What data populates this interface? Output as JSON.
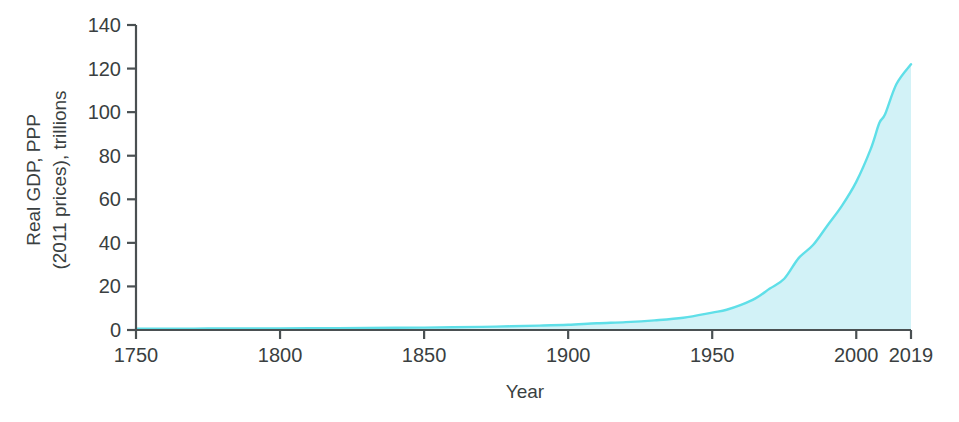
{
  "chart_data": {
    "type": "area",
    "title": "",
    "subtitle": "",
    "xlabel": "Year",
    "ylabel": "Real GDP, PPP\n(2011 prices), trillions",
    "ylabel_line1": "Real GDP, PPP",
    "ylabel_line2": "(2011 prices), trillions",
    "xlim": [
      1750,
      2019
    ],
    "ylim": [
      0,
      140
    ],
    "grid": false,
    "legend": false,
    "legend_position": "none",
    "xticks": [
      1750,
      1800,
      1850,
      1900,
      1950,
      2000,
      2019
    ],
    "xtick_labels": [
      "1750",
      "1800",
      "1850",
      "1900",
      "1950",
      "2000",
      "2019"
    ],
    "yticks": [
      0,
      20,
      40,
      60,
      80,
      100,
      120,
      140
    ],
    "ytick_labels": [
      "0",
      "20",
      "40",
      "60",
      "80",
      "100",
      "120",
      "140"
    ],
    "series": [
      {
        "name": "Real GDP, PPP (2011 prices), trillions",
        "fill_color": "#d2f2f7",
        "line_color": "#5fdfe8",
        "x": [
          1750,
          1760,
          1770,
          1780,
          1790,
          1800,
          1810,
          1820,
          1830,
          1840,
          1850,
          1860,
          1870,
          1880,
          1890,
          1900,
          1910,
          1920,
          1930,
          1940,
          1950,
          1955,
          1960,
          1965,
          1970,
          1975,
          1980,
          1985,
          1990,
          1995,
          2000,
          2005,
          2008,
          2010,
          2014,
          2019
        ],
        "values": [
          0.6,
          0.62,
          0.65,
          0.68,
          0.72,
          0.76,
          0.82,
          0.88,
          0.95,
          1.02,
          1.1,
          1.25,
          1.45,
          1.7,
          2.0,
          2.4,
          3.1,
          3.6,
          4.4,
          5.6,
          8.0,
          9.3,
          11.5,
          14.5,
          19.0,
          23.5,
          33.0,
          39.0,
          48.0,
          57.0,
          68.0,
          83.0,
          95.0,
          99.0,
          113.0,
          122.0
        ]
      }
    ],
    "annotations": []
  },
  "axes": {
    "y_title_line1": "Real GDP, PPP",
    "y_title_line2": "(2011 prices), trillions",
    "x_title": "Year"
  },
  "colors": {
    "area_fill": "#d2f2f7",
    "area_stroke": "#5fdfe8",
    "axis": "#4a5052",
    "text": "#3a3f41",
    "background": "#ffffff"
  }
}
